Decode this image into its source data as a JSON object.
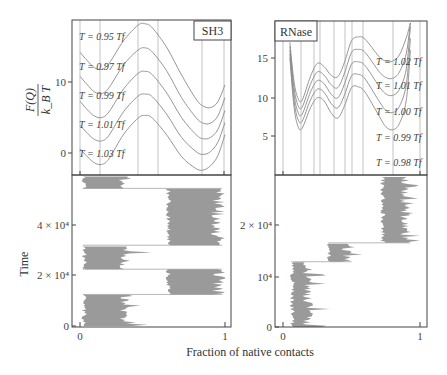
{
  "figure": {
    "x_axis_title": "Fraction of native contacts",
    "y_axis_top_title_num": "F(Q)",
    "y_axis_top_title_den": "k_B T",
    "y_axis_bottom_title": "Time"
  },
  "panels": {
    "sh3": {
      "label": "SH3",
      "y_ticks": [
        "10",
        "0"
      ],
      "x_ticks": [
        "0",
        "1"
      ],
      "time_ticks": [
        "0",
        "2 × 10⁴",
        "4 × 10⁴"
      ],
      "curve_labels": [
        "T = 0.95 Tf",
        "T = 0.97 Tf",
        "T = 0.99 Tf",
        "T = 1.01 Tf",
        "T = 1.03 Tf"
      ]
    },
    "rnase": {
      "label": "RNase",
      "y_ticks": [
        "15",
        "10",
        "5"
      ],
      "x_ticks": [
        "0",
        "1"
      ],
      "time_ticks": [
        "0",
        "10⁴",
        "2 × 10⁴"
      ],
      "curve_labels": [
        "T = 1.02 Tf",
        "T = 1.01 Tf",
        "T = 1.00 Tf",
        "T = 0.99 Tf",
        "T = 0.98 Tf"
      ]
    }
  },
  "colors": {
    "curve": "#8a8a8a",
    "trajectory": "#9a9a9a",
    "frame": "#444444",
    "grid": "#9a9a9a"
  },
  "chart_data": [
    {
      "type": "line",
      "title": "SH3",
      "xlabel": "Fraction of native contacts",
      "ylabel": "F(Q)/k_B T",
      "xlim": [
        0,
        1
      ],
      "ylim": [
        -3,
        19
      ],
      "y_ticks": [
        0,
        10
      ],
      "x_ticks": [
        0,
        1
      ],
      "vertical_gridlines_Q": [
        0,
        0.14,
        0.4,
        0.54,
        0.84,
        0.99
      ],
      "x": [
        0.0,
        0.05,
        0.1,
        0.15,
        0.2,
        0.3,
        0.4,
        0.45,
        0.5,
        0.6,
        0.7,
        0.8,
        0.85,
        0.9,
        0.95,
        1.0
      ],
      "series": [
        {
          "name": "T = 0.95 Tf",
          "values": [
            14.2,
            13.0,
            12.0,
            11.8,
            12.6,
            15.8,
            18.0,
            18.2,
            17.6,
            14.8,
            11.0,
            7.6,
            6.6,
            6.4,
            7.2,
            9.6
          ]
        },
        {
          "name": "T = 0.97 Tf",
          "values": [
            10.8,
            9.6,
            8.6,
            8.4,
            9.2,
            12.4,
            14.5,
            14.8,
            14.2,
            11.5,
            7.8,
            5.0,
            4.2,
            4.2,
            5.2,
            7.8
          ]
        },
        {
          "name": "T = 0.99 Tf",
          "values": [
            7.3,
            6.1,
            5.2,
            5.0,
            5.8,
            9.0,
            11.2,
            11.5,
            11.0,
            8.4,
            5.0,
            2.6,
            2.0,
            2.2,
            3.3,
            6.0
          ]
        },
        {
          "name": "T = 1.01 Tf",
          "values": [
            3.9,
            2.8,
            1.9,
            1.7,
            2.5,
            5.8,
            8.0,
            8.3,
            7.9,
            5.4,
            2.2,
            0.2,
            -0.2,
            0.2,
            1.5,
            4.3
          ]
        },
        {
          "name": "T = 1.03 Tf",
          "values": [
            0.6,
            -0.5,
            -1.4,
            -1.6,
            -0.8,
            2.6,
            4.9,
            5.3,
            4.9,
            2.5,
            -0.5,
            -2.2,
            -2.4,
            -1.8,
            -0.4,
            2.6
          ]
        }
      ]
    },
    {
      "type": "line",
      "title": "RNase",
      "xlabel": "Fraction of native contacts",
      "ylabel": "F(Q)/k_B T",
      "xlim": [
        0,
        1
      ],
      "ylim": [
        0,
        19.5
      ],
      "y_ticks": [
        5,
        10,
        15
      ],
      "x_ticks": [
        0,
        1
      ],
      "vertical_gridlines_Q": [
        0,
        0.13,
        0.23,
        0.27,
        0.37,
        0.45,
        0.5,
        0.58,
        0.8,
        1.0
      ],
      "x": [
        0.05,
        0.08,
        0.11,
        0.14,
        0.2,
        0.25,
        0.3,
        0.35,
        0.4,
        0.45,
        0.5,
        0.55,
        0.6,
        0.7,
        0.75,
        0.8,
        0.85,
        0.9,
        0.93
      ],
      "series": [
        {
          "name": "T = 1.02 Tf",
          "values": [
            17.0,
            12.0,
            9.8,
            9.6,
            12.6,
            14.3,
            13.9,
            12.8,
            12.6,
            14.5,
            17.2,
            17.7,
            17.4,
            15.2,
            14.6,
            14.6,
            15.4,
            17.6,
            19.5
          ]
        },
        {
          "name": "T = 1.01 Tf",
          "values": [
            16.5,
            11.2,
            8.9,
            8.7,
            11.6,
            13.2,
            12.8,
            11.6,
            11.2,
            13.1,
            15.7,
            16.1,
            15.7,
            13.3,
            12.5,
            12.4,
            13.2,
            15.6,
            19.5
          ]
        },
        {
          "name": "T = 1.00 Tf",
          "values": [
            16.0,
            10.4,
            8.0,
            7.8,
            10.6,
            12.1,
            11.7,
            10.4,
            9.9,
            11.7,
            14.2,
            14.5,
            14.0,
            11.4,
            10.4,
            10.2,
            11.0,
            13.6,
            19.0
          ]
        },
        {
          "name": "T = 0.99 Tf",
          "values": [
            15.5,
            9.6,
            7.1,
            6.9,
            9.6,
            11.0,
            10.6,
            9.2,
            8.6,
            10.3,
            12.7,
            12.9,
            12.3,
            9.5,
            8.3,
            8.0,
            8.8,
            11.6,
            17.5
          ]
        },
        {
          "name": "T = 0.98 Tf",
          "values": [
            15.0,
            8.8,
            6.2,
            6.0,
            8.6,
            9.9,
            9.5,
            8.0,
            7.3,
            8.9,
            11.2,
            11.3,
            10.6,
            7.6,
            6.2,
            5.8,
            6.6,
            9.6,
            16.0
          ]
        }
      ]
    },
    {
      "type": "area",
      "title": "SH3 trajectory",
      "xlabel": "Fraction of native contacts",
      "ylabel": "Time",
      "xlim": [
        0,
        1
      ],
      "ylim": [
        0,
        60000
      ],
      "y_ticks": [
        0,
        20000,
        40000
      ],
      "segments": [
        {
          "t_start": 0,
          "t_end": 12500,
          "state": "unfolded",
          "q_range": [
            0.02,
            0.35
          ]
        },
        {
          "t_start": 12500,
          "t_end": 22500,
          "state": "folded",
          "q_range": [
            0.6,
            0.98
          ]
        },
        {
          "t_start": 22500,
          "t_end": 32000,
          "state": "unfolded",
          "q_range": [
            0.02,
            0.35
          ]
        },
        {
          "t_start": 32000,
          "t_end": 54500,
          "state": "folded",
          "q_range": [
            0.6,
            0.98
          ]
        },
        {
          "t_start": 54500,
          "t_end": 60000,
          "state": "unfolded",
          "q_range": [
            0.02,
            0.33
          ]
        }
      ]
    },
    {
      "type": "area",
      "title": "RNase trajectory",
      "xlabel": "Fraction of native contacts",
      "ylabel": "Time",
      "xlim": [
        0,
        1
      ],
      "ylim": [
        0,
        30000
      ],
      "y_ticks": [
        0,
        10000,
        20000
      ],
      "segments": [
        {
          "t_start": 0,
          "t_end": 12800,
          "state": "unfolded",
          "q_range": [
            0.06,
            0.22
          ]
        },
        {
          "t_start": 12800,
          "t_end": 16500,
          "state": "intermediate",
          "q_range": [
            0.33,
            0.5
          ]
        },
        {
          "t_start": 16500,
          "t_end": 30000,
          "state": "folded",
          "q_range": [
            0.72,
            0.93
          ]
        }
      ]
    }
  ]
}
